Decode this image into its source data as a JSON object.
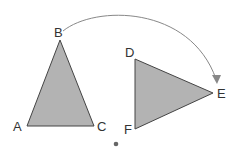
{
  "diagram": {
    "title": "",
    "colors": {
      "fill": "#b3b3b3",
      "stroke": "#444444",
      "arc": "#888888",
      "label": "#333333",
      "center": "#666666"
    },
    "triangle_original": {
      "vertices": [
        {
          "label": "A"
        },
        {
          "label": "B"
        },
        {
          "label": "C"
        }
      ]
    },
    "triangle_image": {
      "vertices": [
        {
          "label": "D"
        },
        {
          "label": "E"
        },
        {
          "label": "F"
        }
      ]
    },
    "labels": {
      "A": "A",
      "B": "B",
      "C": "C",
      "D": "D",
      "E": "E",
      "F": "F"
    },
    "arrow": {
      "from": "B",
      "to": "E"
    },
    "center_point": {
      "label": ""
    }
  }
}
